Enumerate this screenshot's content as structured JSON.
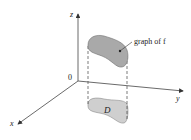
{
  "diagram": {
    "axes": {
      "x_label": "x",
      "y_label": "y",
      "z_label": "z",
      "origin_label": "0"
    },
    "surface_label": "graph of f",
    "domain_label": "D",
    "colors": {
      "axis": "#444444",
      "surface_fill": "#a9a9a9",
      "surface_stroke": "#6e6e6e",
      "domain_fill": "#cfcfcf",
      "domain_stroke": "#8a8a8a",
      "dashed": "#444444"
    }
  }
}
